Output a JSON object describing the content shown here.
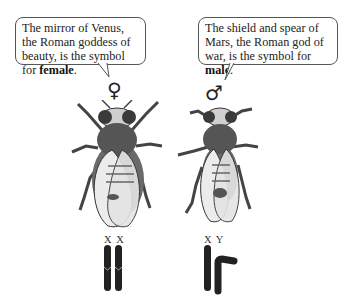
{
  "female": {
    "callout_text": "The mirror of Venus, the Roman goddess of beauty, is the symbol for ",
    "callout_bold": "female",
    "callout_end": ".",
    "symbol": "♀",
    "chromosome_labels": "X X"
  },
  "male": {
    "callout_text": "The shield and spear of Mars, the Roman god of war, is the symbol for ",
    "callout_bold": "male",
    "callout_end": ".",
    "symbol": "♂",
    "chromosome_labels": "X Y"
  },
  "colors": {
    "outline": "#555555",
    "chromosome": "#222222",
    "fly_body": "#4a4a4a",
    "fly_wing": "#e4e4e4"
  }
}
